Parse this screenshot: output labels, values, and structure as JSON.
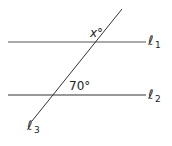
{
  "diagram": {
    "lines": [
      {
        "id": "l1",
        "label_base": "ℓ",
        "label_sub": "1",
        "x1": 8,
        "y1": 42,
        "x2": 146,
        "y2": 42
      },
      {
        "id": "l2",
        "label_base": "ℓ",
        "label_sub": "2",
        "x1": 8,
        "y1": 95,
        "x2": 146,
        "y2": 95
      },
      {
        "id": "l3",
        "label_base": "ℓ",
        "label_sub": "3",
        "x1": 122,
        "y1": 9,
        "x2": 32,
        "y2": 121
      }
    ],
    "angles": [
      {
        "label": "x°",
        "at_line": "l1"
      },
      {
        "label": "70°",
        "at_line": "l2"
      }
    ],
    "colors": {
      "line": "#333333",
      "text": "#222222"
    }
  }
}
